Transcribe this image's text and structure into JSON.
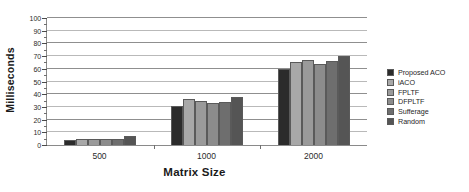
{
  "chart_data": {
    "type": "bar",
    "title": "",
    "xlabel": "Matrix Size",
    "ylabel": "Milliseconds",
    "categories": [
      "500",
      "1000",
      "2000"
    ],
    "ylim": [
      0,
      100
    ],
    "ytick_step": 10,
    "yticks": [
      "0",
      "10",
      "20",
      "30",
      "40",
      "50",
      "60",
      "70",
      "80",
      "90",
      "100"
    ],
    "grid": true,
    "legend_position": "right",
    "series": [
      {
        "name": "Proposed ACO",
        "color": "#2b2b2b",
        "values": [
          4,
          31,
          60
        ]
      },
      {
        "name": "iACO",
        "color": "#a8a8a8",
        "values": [
          5,
          36,
          65
        ]
      },
      {
        "name": "FPLTF",
        "color": "#9a9a9a",
        "values": [
          5,
          35,
          67
        ]
      },
      {
        "name": "DFPLTF",
        "color": "#8c8c8c",
        "values": [
          5,
          33,
          64
        ]
      },
      {
        "name": "Sufferage",
        "color": "#6e6e6e",
        "values": [
          5,
          34,
          66
        ]
      },
      {
        "name": "Random",
        "color": "#555555",
        "values": [
          7,
          38,
          70
        ]
      }
    ]
  }
}
